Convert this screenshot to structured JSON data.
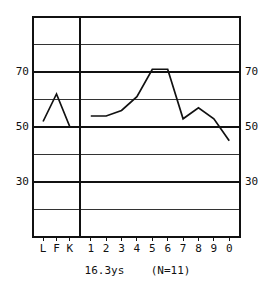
{
  "caption": "16.3ys    (N=11)",
  "axis": {
    "y_labels_left": [
      "70",
      "50",
      "30"
    ],
    "y_labels_right": [
      "70",
      "50",
      "30"
    ],
    "x_labels": [
      "L",
      "F",
      "K",
      "1",
      "2",
      "3",
      "4",
      "5",
      "6",
      "7",
      "8",
      "9",
      "0"
    ]
  },
  "colors": {
    "ink": "#111111",
    "background": "#ffffff",
    "grid_major": "#111111",
    "grid_minor": "#333333"
  },
  "chart_data": {
    "type": "line",
    "title": "16.3ys    (N=11)",
    "subtitle": "",
    "xlabel": "",
    "ylabel": "",
    "ylim": [
      10,
      90
    ],
    "yticks": [
      10,
      20,
      30,
      40,
      50,
      60,
      70,
      80,
      90
    ],
    "ytick_labels": [
      "",
      "",
      "30",
      "",
      "50",
      "",
      "70",
      "",
      ""
    ],
    "major_gridlines": [
      30,
      50,
      70
    ],
    "minor_gridlines": [
      20,
      40,
      60,
      80
    ],
    "grid": true,
    "legend": "none",
    "panels": [
      {
        "name": "validity",
        "categories": [
          "L",
          "F",
          "K"
        ],
        "values": [
          52,
          62,
          50
        ]
      },
      {
        "name": "clinical",
        "categories": [
          "1",
          "2",
          "3",
          "4",
          "5",
          "6",
          "7",
          "8",
          "9",
          "0"
        ],
        "values": [
          54,
          54,
          56,
          61,
          71,
          71,
          53,
          57,
          53,
          45
        ]
      }
    ],
    "categories": [
      "L",
      "F",
      "K",
      "1",
      "2",
      "3",
      "4",
      "5",
      "6",
      "7",
      "8",
      "9",
      "0"
    ],
    "series": [
      {
        "name": "mean profile",
        "values": [
          52,
          62,
          50,
          54,
          54,
          56,
          61,
          71,
          71,
          53,
          57,
          53,
          45
        ]
      }
    ]
  },
  "geometry": {
    "plot_left": 33,
    "plot_right": 240,
    "plot_top": 17,
    "plot_bottom": 237,
    "divider_x": 80
  }
}
